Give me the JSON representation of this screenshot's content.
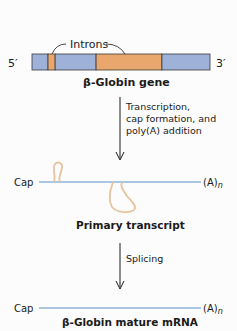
{
  "gene": {
    "five_prime": "5′",
    "three_prime": "3′",
    "introns_label": "Introns",
    "title_greek": "β",
    "title_rest": "-Globin gene",
    "segments": [
      {
        "type": "exon",
        "start": 0.0,
        "end": 0.09
      },
      {
        "type": "intron",
        "start": 0.09,
        "end": 0.13
      },
      {
        "type": "exon",
        "start": 0.13,
        "end": 0.36
      },
      {
        "type": "intron",
        "start": 0.36,
        "end": 0.73
      },
      {
        "type": "exon",
        "start": 0.73,
        "end": 1.0
      }
    ]
  },
  "step1": {
    "lines": [
      "Transcription,",
      "cap formation, and",
      "poly(A) addition"
    ]
  },
  "primary": {
    "cap": "Cap",
    "polya": "(A)",
    "polya_sub": "n",
    "title": "Primary transcript"
  },
  "step2": {
    "label": "Splicing"
  },
  "mature": {
    "cap": "Cap",
    "polya": "(A)",
    "polya_sub": "n",
    "title_greek": "β",
    "title_rest": "-Globin mature mRNA"
  },
  "colors": {
    "exon": "#9db1d9",
    "intron": "#e9a76d",
    "border": "#3a3a3a",
    "rna_line": "#a9c6e2",
    "intron_loop": "#e8c3a0",
    "arrow": "#1a1a1a"
  }
}
